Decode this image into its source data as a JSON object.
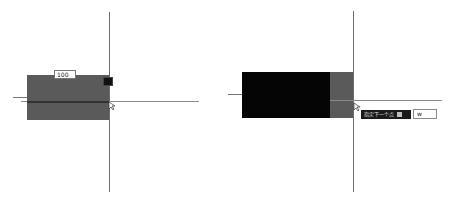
{
  "left_panel": {
    "dimension_input": {
      "value": "100"
    },
    "marker": {
      "label": "",
      "icon": "snap-marker-icon"
    },
    "colors": {
      "rect_fill": "#5a5a5a",
      "axis": "#6e6e6e"
    },
    "cursor": {
      "icon": "arrow-cursor-icon"
    }
  },
  "right_panel": {
    "prompt": {
      "label": "指定下一个点",
      "option_icon": "options-icon"
    },
    "command_input": {
      "value": "w"
    },
    "colors": {
      "black_fill": "#050505",
      "gray_fill": "#5a5a5a",
      "axis": "#6e6e6e"
    },
    "cursor": {
      "icon": "arrow-cursor-icon"
    }
  }
}
